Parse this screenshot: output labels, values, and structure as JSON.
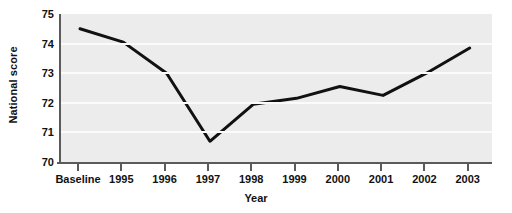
{
  "chart_data": {
    "type": "line",
    "title": "",
    "xlabel": "Year",
    "ylabel": "National score",
    "categories": [
      "Baseline",
      "1995",
      "1996",
      "1997",
      "1998",
      "1999",
      "2000",
      "2001",
      "2002",
      "2003"
    ],
    "values": [
      74.5,
      74.05,
      73.0,
      70.7,
      71.95,
      72.15,
      72.55,
      72.25,
      73.0,
      73.85
    ],
    "series": [
      {
        "name": "National score",
        "values": [
          74.5,
          74.05,
          73.0,
          70.7,
          71.95,
          72.15,
          72.55,
          72.25,
          73.0,
          73.85
        ]
      }
    ],
    "ylim": [
      70,
      75
    ],
    "yticks": [
      70,
      71,
      72,
      73,
      74,
      75
    ],
    "ytick_labels": [
      "70",
      "71",
      "72",
      "73",
      "74",
      "75"
    ],
    "grid": true,
    "grid_axis": "y",
    "legend": "none",
    "line_color": "#111111",
    "line_width": 3,
    "plot_background": "#ececec",
    "gridline_color": "#fbfbfb",
    "axis_color": "#5a5a5a",
    "text_color": "#111111"
  }
}
